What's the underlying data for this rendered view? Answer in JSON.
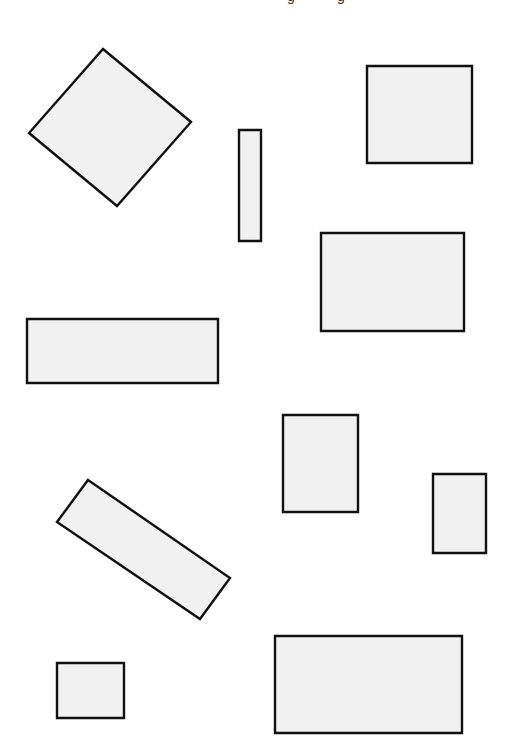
{
  "canvas": {
    "width": 507,
    "height": 751,
    "background": "#ffffff"
  },
  "style": {
    "fill": "#f1f1f1",
    "stroke": "#111111",
    "stroke_width": 2.4
  },
  "top_text_fragments": [
    {
      "text": "g",
      "x": 287
    },
    {
      "text": "g",
      "x": 337
    }
  ],
  "shapes": [
    {
      "id": "diamond-square",
      "type": "rotated-square",
      "points": [
        [
          103,
          49
        ],
        [
          191,
          122
        ],
        [
          117,
          206
        ],
        [
          29,
          133
        ]
      ]
    },
    {
      "id": "thin-vertical-rect",
      "type": "rect",
      "points": [
        [
          239,
          130
        ],
        [
          261,
          130
        ],
        [
          261,
          241
        ],
        [
          239,
          241
        ]
      ]
    },
    {
      "id": "top-right-square",
      "type": "rect",
      "points": [
        [
          367,
          66
        ],
        [
          472,
          66
        ],
        [
          472,
          163
        ],
        [
          367,
          163
        ]
      ]
    },
    {
      "id": "middle-right-rect",
      "type": "rect",
      "points": [
        [
          321,
          233
        ],
        [
          464,
          233
        ],
        [
          464,
          331
        ],
        [
          321,
          331
        ]
      ]
    },
    {
      "id": "left-wide-rect",
      "type": "rect",
      "points": [
        [
          27,
          319
        ],
        [
          218,
          319
        ],
        [
          218,
          383
        ],
        [
          27,
          383
        ]
      ]
    },
    {
      "id": "center-tall-rect",
      "type": "rect",
      "points": [
        [
          283,
          415
        ],
        [
          358,
          415
        ],
        [
          358,
          512
        ],
        [
          283,
          512
        ]
      ]
    },
    {
      "id": "right-small-tall-rect",
      "type": "rect",
      "points": [
        [
          433,
          474
        ],
        [
          486,
          474
        ],
        [
          486,
          553
        ],
        [
          433,
          553
        ]
      ]
    },
    {
      "id": "tilted-rect",
      "type": "rotated-rect",
      "points": [
        [
          88,
          480
        ],
        [
          230,
          578
        ],
        [
          200,
          619
        ],
        [
          57,
          522
        ]
      ]
    },
    {
      "id": "bottom-left-small-rect",
      "type": "rect",
      "points": [
        [
          57,
          663
        ],
        [
          124,
          663
        ],
        [
          124,
          718
        ],
        [
          57,
          718
        ]
      ]
    },
    {
      "id": "bottom-right-wide-rect",
      "type": "rect",
      "points": [
        [
          275,
          636
        ],
        [
          462,
          636
        ],
        [
          462,
          733
        ],
        [
          275,
          733
        ]
      ]
    }
  ]
}
